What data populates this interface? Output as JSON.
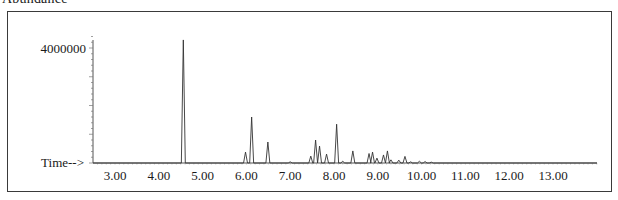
{
  "header": {
    "title": "Abundance"
  },
  "chart_data": {
    "type": "line",
    "title": "Abundance",
    "xlabel": "Time-->",
    "ylabel": "",
    "x_ticks": [
      "3.00",
      "4.00",
      "5.00",
      "6.00",
      "7.00",
      "8.00",
      "9.00",
      "10.00",
      "11.00",
      "12.00",
      "13.00"
    ],
    "y_ticks": [
      "4000000"
    ],
    "xlim": [
      2.5,
      14.0
    ],
    "ylim": [
      0,
      4400000
    ],
    "grid": false,
    "legend": null,
    "peaks": [
      {
        "rt": 4.56,
        "abundance": 4280000
      },
      {
        "rt": 5.98,
        "abundance": 380000
      },
      {
        "rt": 6.12,
        "abundance": 1600000
      },
      {
        "rt": 6.49,
        "abundance": 730000
      },
      {
        "rt": 7.0,
        "abundance": 40000
      },
      {
        "rt": 7.47,
        "abundance": 240000
      },
      {
        "rt": 7.58,
        "abundance": 800000
      },
      {
        "rt": 7.67,
        "abundance": 590000
      },
      {
        "rt": 7.83,
        "abundance": 310000
      },
      {
        "rt": 8.06,
        "abundance": 1350000
      },
      {
        "rt": 8.2,
        "abundance": 60000
      },
      {
        "rt": 8.43,
        "abundance": 420000
      },
      {
        "rt": 8.8,
        "abundance": 330000
      },
      {
        "rt": 8.88,
        "abundance": 380000
      },
      {
        "rt": 8.98,
        "abundance": 170000
      },
      {
        "rt": 9.13,
        "abundance": 280000
      },
      {
        "rt": 9.22,
        "abundance": 420000
      },
      {
        "rt": 9.3,
        "abundance": 110000
      },
      {
        "rt": 9.48,
        "abundance": 100000
      },
      {
        "rt": 9.62,
        "abundance": 230000
      },
      {
        "rt": 9.75,
        "abundance": 40000
      },
      {
        "rt": 9.95,
        "abundance": 60000
      },
      {
        "rt": 10.08,
        "abundance": 50000
      },
      {
        "rt": 10.22,
        "abundance": 30000
      }
    ]
  }
}
